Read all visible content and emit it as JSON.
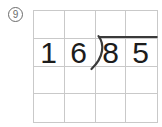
{
  "problem": {
    "number": "9",
    "divisor": "16",
    "dividend": "85",
    "divisor_digits": [
      "1",
      "6"
    ],
    "dividend_digits": [
      "8",
      "5"
    ],
    "operation": "long-division"
  },
  "grid": {
    "columns": 4,
    "rows": 4
  },
  "colors": {
    "ink": "#1c1c1c",
    "bracket": "#3a3a3a",
    "grid_line": "#c9c9c9",
    "badge": "#6b6b6b",
    "background": "#ffffff"
  }
}
